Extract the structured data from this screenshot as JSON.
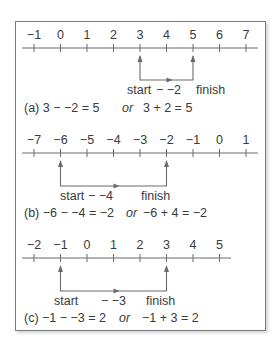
{
  "panels": [
    {
      "id": "a",
      "ticks": [
        "−1",
        "0",
        "1",
        "2",
        "3",
        "4",
        "5",
        "6",
        "7"
      ],
      "line_y": 48,
      "line_x2": 258,
      "start_index": 4,
      "finish_index": 6,
      "bracket_y": 80,
      "start_label": "start",
      "step_label": "− −2",
      "finish_label": "finish",
      "equation_left": "(a) 3 − −2 = 5",
      "or_label": "or",
      "equation_right": "3 + 2 = 5"
    },
    {
      "id": "b",
      "ticks": [
        "−7",
        "−6",
        "−5",
        "−4",
        "−3",
        "−2",
        "−1",
        "0",
        "1"
      ],
      "line_y": 153,
      "line_x2": 258,
      "start_index": 1,
      "finish_index": 5,
      "bracket_y": 186,
      "start_label": "start",
      "step_label": "− −4",
      "finish_label": "finish",
      "equation_left": "(b) −6 − −4 = −2",
      "or_label": "or",
      "equation_right": "−6 + 4 = −2"
    },
    {
      "id": "c",
      "ticks": [
        "−2",
        "−1",
        "0",
        "1",
        "2",
        "3",
        "4",
        "5"
      ],
      "line_y": 258,
      "line_x2": 231,
      "start_index": 1,
      "finish_index": 5,
      "bracket_y": 291,
      "start_label": "start",
      "step_label": "− −3",
      "finish_label": "finish",
      "equation_left": "(c) −1 − −3 = 2",
      "or_label": "or",
      "equation_right": "−1 + 3 = 2"
    }
  ],
  "colors": {
    "line": "#6a6a6a",
    "text": "#3a3a3a",
    "frame": "#7a7a7a"
  }
}
